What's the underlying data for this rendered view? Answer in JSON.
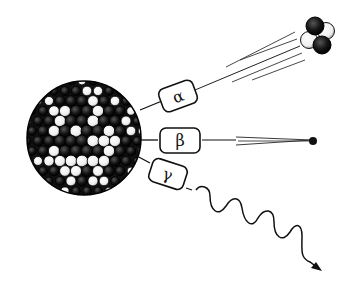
{
  "diagram": {
    "type": "radioactive-decay-illustration",
    "colors": {
      "ink": "#111111",
      "background": "#ffffff"
    },
    "nucleus": {
      "label": ""
    },
    "emissions": [
      {
        "id": "alpha",
        "symbol": "α",
        "depiction": "helium nucleus (2 protons + 2 neutrons) with motion lines"
      },
      {
        "id": "beta",
        "symbol": "β",
        "depiction": "electron with motion trail"
      },
      {
        "id": "gamma",
        "symbol": "γ",
        "depiction": "wavy electromagnetic ray with arrowhead"
      }
    ]
  }
}
